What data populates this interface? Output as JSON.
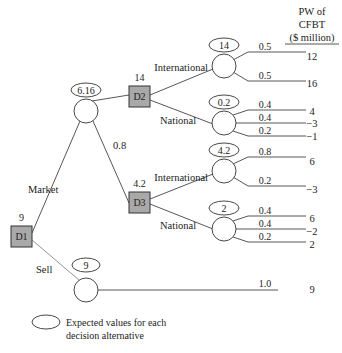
{
  "header": {
    "line1": "PW of",
    "line2": "CFBT",
    "line3": "($ million)"
  },
  "decision_nodes": {
    "d1": {
      "label": "D1",
      "value": "9"
    },
    "d2": {
      "label": "D2",
      "value": "14"
    },
    "d3": {
      "label": "D3",
      "value": "4.2"
    }
  },
  "branches": {
    "market": "Market",
    "sell": "Sell",
    "high": "High",
    "high_prob": "0.2",
    "low": "Low",
    "low_prob": "0.8",
    "d2_international": "International",
    "d2_national": "National",
    "d3_international": "International",
    "d3_national": "National"
  },
  "expected_values": {
    "market": "6.16",
    "sell": "9",
    "d2_international": "14",
    "d2_national": "0.2",
    "d3_international": "4.2",
    "d3_national": "2"
  },
  "outcomes": {
    "d2_intl": [
      {
        "prob": "0.5",
        "pw": "12"
      },
      {
        "prob": "0.5",
        "pw": "16"
      }
    ],
    "d2_natl": [
      {
        "prob": "0.4",
        "pw": "4"
      },
      {
        "prob": "0.4",
        "pw": "−3"
      },
      {
        "prob": "0.2",
        "pw": "−1"
      }
    ],
    "d3_intl": [
      {
        "prob": "0.8",
        "pw": "6"
      },
      {
        "prob": "0.2",
        "pw": "−3"
      }
    ],
    "d3_natl": [
      {
        "prob": "0.4",
        "pw": "6"
      },
      {
        "prob": "0.4",
        "pw": "−2"
      },
      {
        "prob": "0.2",
        "pw": "2"
      }
    ],
    "sell": [
      {
        "prob": "1.0",
        "pw": "9"
      }
    ]
  },
  "legend": {
    "line1": "Expected values for each",
    "line2": "decision alternative"
  }
}
